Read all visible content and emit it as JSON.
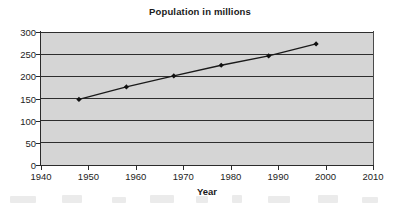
{
  "chart_data": {
    "type": "line",
    "title": "Population in millions",
    "xlabel": "Year",
    "ylabel": "",
    "xlim": [
      1940,
      2010
    ],
    "ylim": [
      0,
      300
    ],
    "grid": true,
    "legend": false,
    "x_ticks": [
      1940,
      1950,
      1960,
      1970,
      1980,
      1990,
      2000,
      2010
    ],
    "y_ticks": [
      0,
      50,
      100,
      150,
      200,
      250,
      300
    ],
    "marker": "diamond",
    "line_color": "#1a1a1a",
    "marker_color": "#111111",
    "plot_background": "#d5d5d5",
    "series": [
      {
        "name": "Population in millions",
        "x": [
          1948,
          1958,
          1968,
          1978,
          1988,
          1998
        ],
        "values": [
          148,
          176,
          201,
          225,
          246,
          273
        ]
      }
    ]
  },
  "colors": {
    "plot_bg": "#d5d5d5",
    "grid": "#2e2e2e",
    "axis": "#2b2b2b",
    "text": "#1a1a1a",
    "page_bg": "#ffffff"
  }
}
